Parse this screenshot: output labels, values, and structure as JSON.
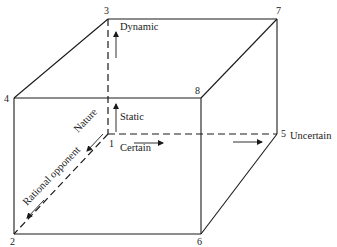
{
  "diagram": {
    "type": "cube",
    "colors": {
      "line": "#1a1a1a",
      "background": "#ffffff"
    },
    "vertices": {
      "v1": "1",
      "v2": "2",
      "v3": "3",
      "v4": "4",
      "v5": "5",
      "v6": "6",
      "v7": "7",
      "v8": "8"
    },
    "axes": {
      "vertical": {
        "low": "Static",
        "high": "Dynamic"
      },
      "horizontal": {
        "low": "Certain",
        "high": "Uncertain"
      },
      "depth": {
        "low": "Nature",
        "high": "Rational opponent"
      }
    }
  }
}
